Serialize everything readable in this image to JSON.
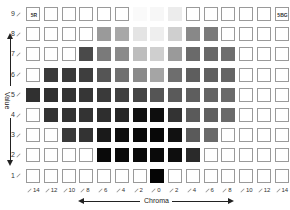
{
  "chart": {
    "title": "",
    "x_axis_label": "Chroma",
    "y_axis_label": "Value",
    "hue_left_label": "5R",
    "hue_right_label": "5BG",
    "chroma_labels": [
      "14",
      "12",
      "10",
      "8",
      "6",
      "4",
      "2",
      "0",
      "2",
      "4",
      "6",
      "8",
      "10",
      "12",
      "14"
    ],
    "value_labels": [
      "9",
      "8",
      "7",
      "6",
      "5",
      "4",
      "3",
      "2",
      "1"
    ]
  },
  "chart_data": {
    "type": "heatmap",
    "xlabel": "Chroma",
    "ylabel": "Value",
    "x": [
      "14",
      "12",
      "10",
      "8",
      "6",
      "4",
      "2",
      "0",
      "2",
      "4",
      "6",
      "8",
      "10",
      "12",
      "14"
    ],
    "y": [
      "9",
      "8",
      "7",
      "6",
      "5",
      "4",
      "3",
      "2",
      "1"
    ],
    "empty_color": null,
    "rows": [
      [
        null,
        null,
        null,
        null,
        null,
        null,
        "#fafafa",
        "#f7f7f7",
        "#ececec",
        null,
        null,
        null,
        null,
        null,
        null
      ],
      [
        null,
        null,
        null,
        null,
        "#9a9a9a",
        "#a8a8a8",
        "#e4e4e4",
        "#eeeeee",
        "#cfcfcf",
        "#888888",
        "#7a7a7a",
        null,
        null,
        null,
        null
      ],
      [
        null,
        null,
        null,
        "#4a4a4a",
        "#7a7a7a",
        "#8a8a8a",
        "#bdbdbd",
        "#cfcfcf",
        "#9a9a9a",
        "#6a6a6a",
        "#686868",
        "#6e6e6e",
        null,
        null,
        null
      ],
      [
        null,
        "#3a3a3a",
        "#3a3a3a",
        "#3e3e3e",
        "#555555",
        "#707070",
        "#8a8a8a",
        "#a5a5a5",
        "#6e6e6e",
        "#5e5e5e",
        "#606060",
        "#656565",
        null,
        null,
        null
      ],
      [
        "#303030",
        "#303030",
        "#333333",
        "#363636",
        "#3a3a3a",
        "#404040",
        "#454545",
        "#555555",
        "#5a5a5a",
        "#5e5e5e",
        "#646464",
        "#6a6a6a",
        null,
        null,
        null
      ],
      [
        null,
        "#333333",
        "#333333",
        "#333333",
        "#2e2e2e",
        "#262626",
        "#111111",
        "#0e0e0e",
        "#333333",
        "#5a5a5a",
        "#606060",
        "#6a6a6a",
        null,
        null,
        null
      ],
      [
        null,
        null,
        "#3a3a3a",
        "#333333",
        "#1a1a1a",
        "#0e0e0e",
        "#0a0a0a",
        "#080808",
        "#111111",
        "#5a5a5a",
        "#6a6a6a",
        null,
        null,
        null,
        null
      ],
      [
        null,
        null,
        null,
        null,
        "#0a0a0a",
        "#0a0a0a",
        "#0a0a0a",
        "#0a0a0a",
        "#0e0e0e",
        "#2a2a2a",
        null,
        null,
        null,
        null,
        null
      ],
      [
        null,
        null,
        null,
        null,
        null,
        null,
        null,
        "#050505",
        null,
        null,
        null,
        null,
        null,
        null,
        null
      ]
    ]
  }
}
